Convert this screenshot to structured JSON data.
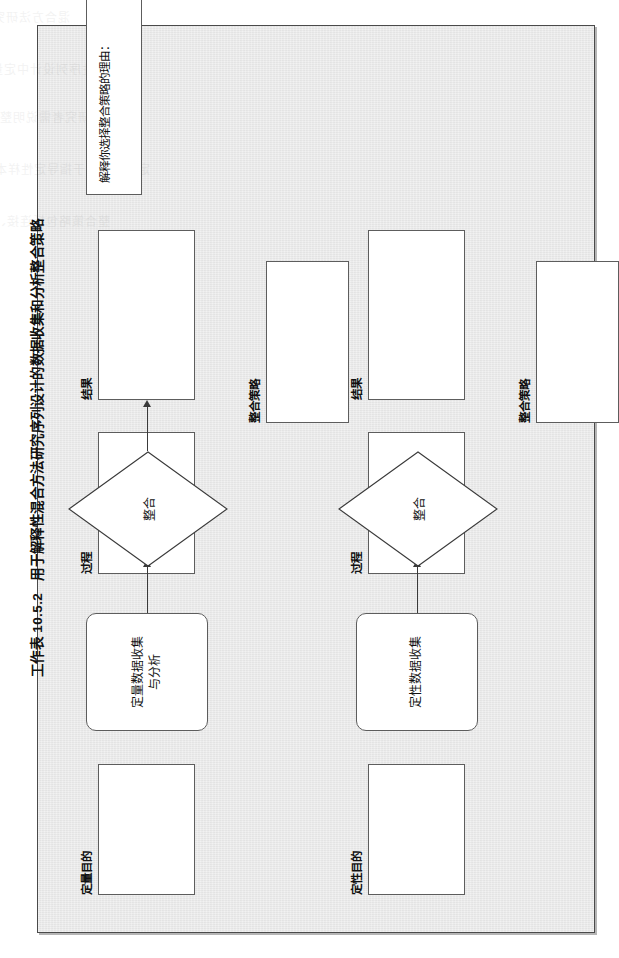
{
  "worksheet": {
    "number": "工作表 10.5.2",
    "title": "用于解释性混合方法研究序列设计的数据收集和分析整合策略"
  },
  "diagram": {
    "type": "flowchart",
    "orientation": "left-to-right, rotated 90° on page",
    "column_labels": [
      {
        "id": "quant-purpose",
        "label": "定量目的"
      },
      {
        "id": "quant-process",
        "label": "过程"
      },
      {
        "id": "quant-results",
        "label": "结果"
      },
      {
        "id": "integration-strategy-1",
        "label": "整合策略"
      },
      {
        "id": "qual-purpose",
        "label": "定性目的"
      },
      {
        "id": "qual-process",
        "label": "过程"
      },
      {
        "id": "qual-results",
        "label": "结果"
      },
      {
        "id": "integration-strategy-2",
        "label": "整合策略"
      }
    ],
    "nodes": [
      {
        "id": "quant-purpose-box",
        "label": "",
        "shape": "rect",
        "fill_in": true
      },
      {
        "id": "quant-data-box",
        "label": "定量数据收集\n与分析",
        "label_line1": "定量数据收集",
        "label_line2": "与分析",
        "shape": "rounded-rect"
      },
      {
        "id": "quant-process-box",
        "label": "",
        "shape": "rect",
        "fill_in": true
      },
      {
        "id": "quant-results-box",
        "label": "",
        "shape": "rect",
        "fill_in": true
      },
      {
        "id": "integration-diamond-1",
        "label": "整合",
        "shape": "diamond"
      },
      {
        "id": "integration-strategy-box-1",
        "label": "",
        "shape": "rect",
        "fill_in": true
      },
      {
        "id": "qual-purpose-box",
        "label": "",
        "shape": "rect",
        "fill_in": true
      },
      {
        "id": "qual-data-box",
        "label": "定性数据收集",
        "shape": "rounded-rect"
      },
      {
        "id": "qual-process-box",
        "label": "",
        "shape": "rect",
        "fill_in": true
      },
      {
        "id": "qual-results-box",
        "label": "",
        "shape": "rect",
        "fill_in": true
      },
      {
        "id": "integration-diamond-2",
        "label": "整合",
        "shape": "diamond"
      },
      {
        "id": "integration-strategy-box-2",
        "label": "",
        "shape": "rect",
        "fill_in": true
      }
    ],
    "flow_sequence": [
      "定量数据收集与分析",
      "整合",
      "定性数据收集",
      "整合"
    ],
    "rationale_prompt": "解释你选择整合策略的理由："
  },
  "ghost_bleed_lines": [
    "混合方法研究的数据收集与分析整合设计",
    "解释性序列设计中定量与定性阶段的衔接",
    "研究者需说明整合点的时间、方式与目的",
    "定量结果用于指导定性样本与访谈提纲的选择",
    "整合策略包括连接、构建、合并与嵌入等形式"
  ],
  "colors": {
    "page_background": "#ffffff",
    "sheet_background": "#e9e9e9",
    "frame_border": "#4a4a4a",
    "node_fill": "#ffffff",
    "node_border": "#5d5d5d",
    "text": "#111111",
    "connector": "#3a3a3a"
  }
}
